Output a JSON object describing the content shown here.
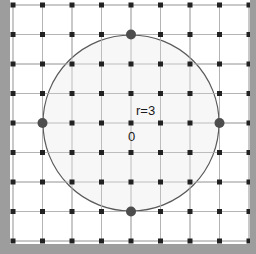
{
  "figure": {
    "width": 256,
    "height": 254,
    "background_color": "#9d9d9d",
    "plot_background_color": "#ffffff"
  },
  "labels": {
    "radius": "r=3",
    "origin": "0"
  },
  "colors": {
    "gridline": "#b4b4b4",
    "lattice_point": "#222222",
    "highlight_point": "#4d4d4d",
    "circle_stroke": "#5a5a5a",
    "circle_fill": "#f7f7f7",
    "border": "#9d9d9d",
    "plot_background": "#ffffff"
  },
  "chart_data": {
    "type": "scatter",
    "xlabel": "",
    "ylabel": "",
    "xlim": [
      -4,
      4
    ],
    "ylim": [
      -4,
      4
    ],
    "grid": true,
    "legend_position": "none",
    "xticks": [
      -4,
      -3,
      -2,
      -1,
      0,
      1,
      2,
      3,
      4
    ],
    "yticks": [
      -4,
      -3,
      -2,
      -1,
      0,
      1,
      2,
      3,
      4
    ],
    "grid_spacing_px": 29.5,
    "origin_px": [
      131,
      123
    ],
    "annotations": [
      {
        "text": "r=3",
        "x": 0,
        "y": 0.6,
        "px": [
          126,
          104
        ]
      },
      {
        "text": "0",
        "x": -0.45,
        "y": -0.3,
        "px": [
          118,
          130
        ]
      }
    ],
    "circle": {
      "center": [
        0,
        0
      ],
      "radius": 3,
      "radius_px": 88,
      "stroke": "#5a5a5a",
      "fill": "#f7f7f7",
      "stroke_width": 1.2
    },
    "series": [
      {
        "name": "lattice points",
        "marker": "square",
        "marker_size_px": 5,
        "color": "#222222",
        "points": [
          [
            -4,
            -4
          ],
          [
            -3,
            -4
          ],
          [
            -2,
            -4
          ],
          [
            -1,
            -4
          ],
          [
            0,
            -4
          ],
          [
            1,
            -4
          ],
          [
            2,
            -4
          ],
          [
            3,
            -4
          ],
          [
            4,
            -4
          ],
          [
            -4,
            -3
          ],
          [
            -3,
            -3
          ],
          [
            -2,
            -3
          ],
          [
            -1,
            -3
          ],
          [
            1,
            -3
          ],
          [
            2,
            -3
          ],
          [
            3,
            -3
          ],
          [
            4,
            -3
          ],
          [
            -4,
            -2
          ],
          [
            -3,
            -2
          ],
          [
            -2,
            -2
          ],
          [
            -1,
            -2
          ],
          [
            0,
            -2
          ],
          [
            1,
            -2
          ],
          [
            2,
            -2
          ],
          [
            3,
            -2
          ],
          [
            4,
            -2
          ],
          [
            -4,
            -1
          ],
          [
            -3,
            -1
          ],
          [
            -2,
            -1
          ],
          [
            -1,
            -1
          ],
          [
            0,
            -1
          ],
          [
            1,
            -1
          ],
          [
            2,
            -1
          ],
          [
            3,
            -1
          ],
          [
            4,
            -1
          ],
          [
            -4,
            0
          ],
          [
            -2,
            0
          ],
          [
            -1,
            0
          ],
          [
            0,
            0
          ],
          [
            1,
            0
          ],
          [
            2,
            0
          ],
          [
            4,
            0
          ],
          [
            -4,
            1
          ],
          [
            -3,
            1
          ],
          [
            -2,
            1
          ],
          [
            -1,
            1
          ],
          [
            0,
            1
          ],
          [
            1,
            1
          ],
          [
            2,
            1
          ],
          [
            3,
            1
          ],
          [
            4,
            1
          ],
          [
            -4,
            2
          ],
          [
            -3,
            2
          ],
          [
            -2,
            2
          ],
          [
            -1,
            2
          ],
          [
            0,
            2
          ],
          [
            1,
            2
          ],
          [
            2,
            2
          ],
          [
            3,
            2
          ],
          [
            4,
            2
          ],
          [
            -4,
            3
          ],
          [
            -3,
            3
          ],
          [
            -2,
            3
          ],
          [
            -1,
            3
          ],
          [
            1,
            3
          ],
          [
            2,
            3
          ],
          [
            3,
            3
          ],
          [
            4,
            3
          ],
          [
            -4,
            4
          ],
          [
            -3,
            4
          ],
          [
            -2,
            4
          ],
          [
            -1,
            4
          ],
          [
            0,
            4
          ],
          [
            1,
            4
          ],
          [
            2,
            4
          ],
          [
            3,
            4
          ],
          [
            4,
            4
          ]
        ]
      },
      {
        "name": "points on circle",
        "marker": "circle",
        "marker_size_px": 10,
        "color": "#4d4d4d",
        "points": [
          [
            0,
            3
          ],
          [
            3,
            0
          ],
          [
            0,
            -3
          ],
          [
            -3,
            0
          ]
        ]
      }
    ]
  }
}
